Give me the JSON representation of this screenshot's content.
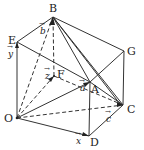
{
  "diagram": {
    "type": "parallelepiped-vectors",
    "colors": {
      "line": "#333333",
      "background": "#ffffff"
    },
    "points": {
      "O": {
        "label": "O",
        "x": 17,
        "y": 118
      },
      "D": {
        "label": "D",
        "x": 89,
        "y": 136
      },
      "C": {
        "label": "C",
        "x": 123,
        "y": 105
      },
      "F": {
        "label": "F",
        "x": 54,
        "y": 76
      },
      "E": {
        "label": "E",
        "x": 17,
        "y": 42
      },
      "B": {
        "label": "B",
        "x": 53,
        "y": 17
      },
      "G": {
        "label": "G",
        "x": 124,
        "y": 51
      },
      "A": {
        "label": "A",
        "x": 90,
        "y": 82
      }
    },
    "vectors": {
      "x": {
        "label": "x",
        "from": "O",
        "to": "D"
      },
      "y": {
        "label": "y",
        "from": "O",
        "to": "E"
      },
      "z": {
        "label": "z",
        "from": "O",
        "to": "F"
      },
      "a": {
        "label": "a",
        "from": "O",
        "to": "A"
      },
      "b": {
        "label": "b",
        "from": "O",
        "to": "B"
      },
      "c": {
        "label": "c",
        "from": "O",
        "to": "C"
      }
    }
  }
}
